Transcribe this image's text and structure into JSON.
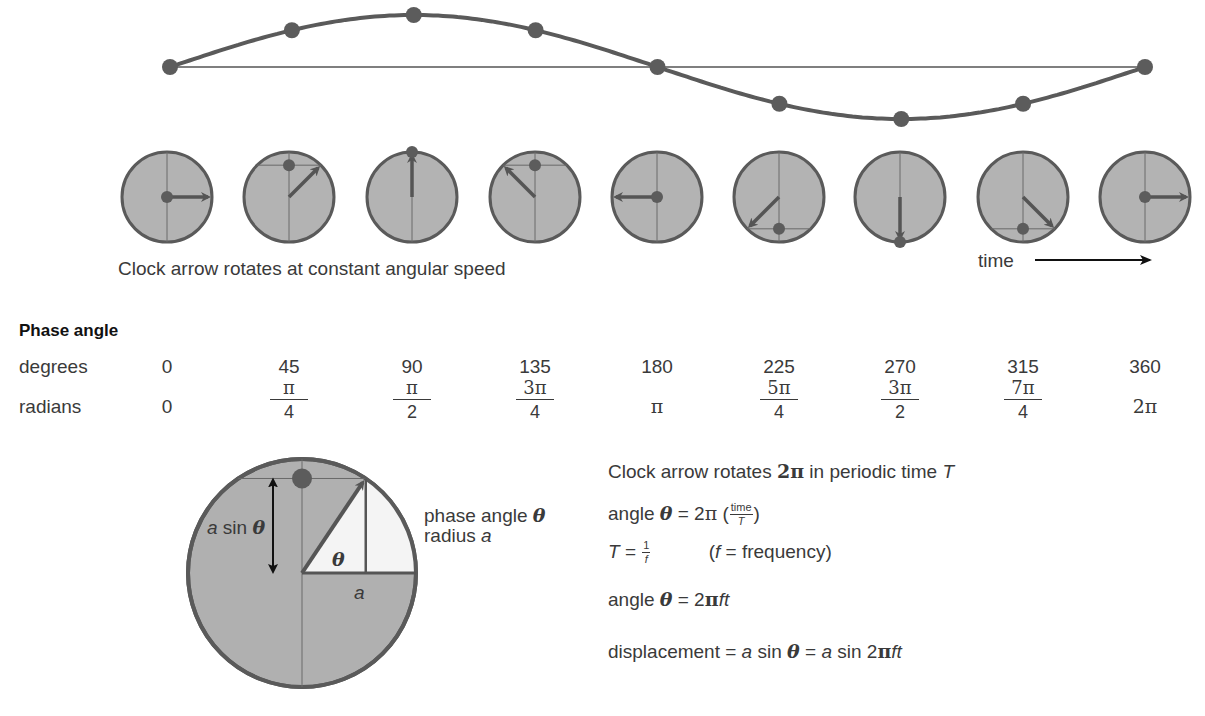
{
  "wave": {
    "baseline_y": 67,
    "amplitude": 52,
    "x_start": 170,
    "x_end": 1145,
    "points_degrees": [
      0,
      45,
      90,
      135,
      180,
      225,
      270,
      315,
      360
    ],
    "line_color": "#5a5a5a",
    "dot_color": "#5c5c5c"
  },
  "clocks": {
    "centers_x": [
      167,
      289,
      412,
      535,
      657,
      779,
      900,
      1023,
      1145
    ],
    "center_y": 197,
    "radius": 45,
    "angles_degrees": [
      0,
      45,
      90,
      135,
      180,
      225,
      270,
      315,
      360
    ],
    "fill_color": "#b3b3b3",
    "stroke_color": "#5a5a5a",
    "caption": "Clock arrow rotates at constant angular speed",
    "time_label": "time"
  },
  "phase_table": {
    "heading": "Phase angle",
    "row_labels": {
      "degrees": "degrees",
      "radians": "radians"
    },
    "columns_x": [
      167,
      289,
      412,
      535,
      657,
      779,
      900,
      1023,
      1145
    ],
    "degrees": [
      "0",
      "45",
      "90",
      "135",
      "180",
      "225",
      "270",
      "315",
      "360"
    ],
    "radians": [
      {
        "type": "single",
        "text": "0"
      },
      {
        "type": "frac",
        "num": "π",
        "den": "4"
      },
      {
        "type": "frac",
        "num": "π",
        "den": "2"
      },
      {
        "type": "frac",
        "num": "3π",
        "den": "4"
      },
      {
        "type": "single",
        "text": "π"
      },
      {
        "type": "frac",
        "num": "5π",
        "den": "4"
      },
      {
        "type": "frac",
        "num": "3π",
        "den": "2"
      },
      {
        "type": "frac",
        "num": "7π",
        "den": "4"
      },
      {
        "type": "single",
        "text": "2π"
      }
    ]
  },
  "detail_circle": {
    "center_x": 302,
    "center_y": 573,
    "radius": 114,
    "angle_degrees": 56,
    "label_a_sin_theta": {
      "a": "a",
      "sin": "sin",
      "theta": "θ"
    },
    "label_theta": "θ",
    "label_a": "a",
    "legend_phase": "phase angle",
    "legend_theta": "θ",
    "legend_radius": "radius",
    "legend_a": "a"
  },
  "equations": {
    "line1": {
      "text": "Clock arrow rotates ",
      "two_pi": "2π",
      "rest": " in periodic time ",
      "T": "T"
    },
    "line2": {
      "prefix": "angle ",
      "theta": "θ",
      "eq": " = 2",
      "pi": "π",
      "open": " (",
      "num": "time",
      "den": "T",
      "close": ")"
    },
    "line3": {
      "T": "T",
      "eq": " = ",
      "num": "1",
      "den": "f",
      "note_open": "(",
      "f": "f",
      "note_rest": " = frequency)"
    },
    "line4": {
      "prefix": "angle ",
      "theta": "θ",
      "eq": " = 2",
      "pi": "π",
      "ft": "ft"
    },
    "line5": {
      "prefix": "displacement = ",
      "a1": "a",
      "sin1": " sin ",
      "theta": "θ",
      "eq": " = ",
      "a2": "a",
      "sin2": " sin 2",
      "pi": "π",
      "ft": "ft"
    }
  }
}
